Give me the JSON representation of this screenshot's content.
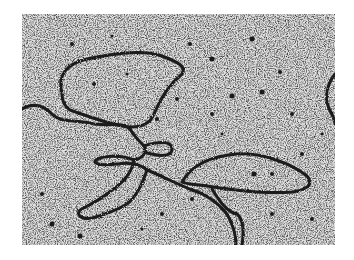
{
  "image": {
    "subject": "electron micrograph of DNA strands with replication loops",
    "background_color": "#d8d8d8",
    "strand_color": "#1a1a1a"
  }
}
